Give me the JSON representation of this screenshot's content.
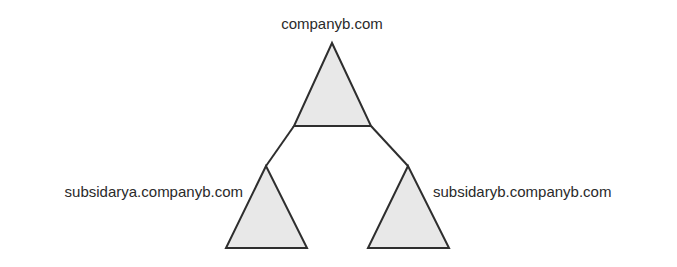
{
  "diagram": {
    "type": "domain-tree",
    "colors": {
      "stroke": "#2e2e2e",
      "fill": "#e8e8e8",
      "text": "#2a2a2a",
      "background": "#ffffff"
    },
    "root": {
      "label": "companyb.com",
      "children": [
        {
          "label": "subsidarya.companyb.com"
        },
        {
          "label": "subsidaryb.companyb.com"
        }
      ]
    },
    "nodes": [
      {
        "id": "root",
        "label": "companyb.com"
      },
      {
        "id": "left",
        "label": "subsidarya.companyb.com"
      },
      {
        "id": "right",
        "label": "subsidaryb.companyb.com"
      }
    ],
    "edges": [
      {
        "from": "root",
        "to": "left"
      },
      {
        "from": "root",
        "to": "right"
      }
    ]
  }
}
